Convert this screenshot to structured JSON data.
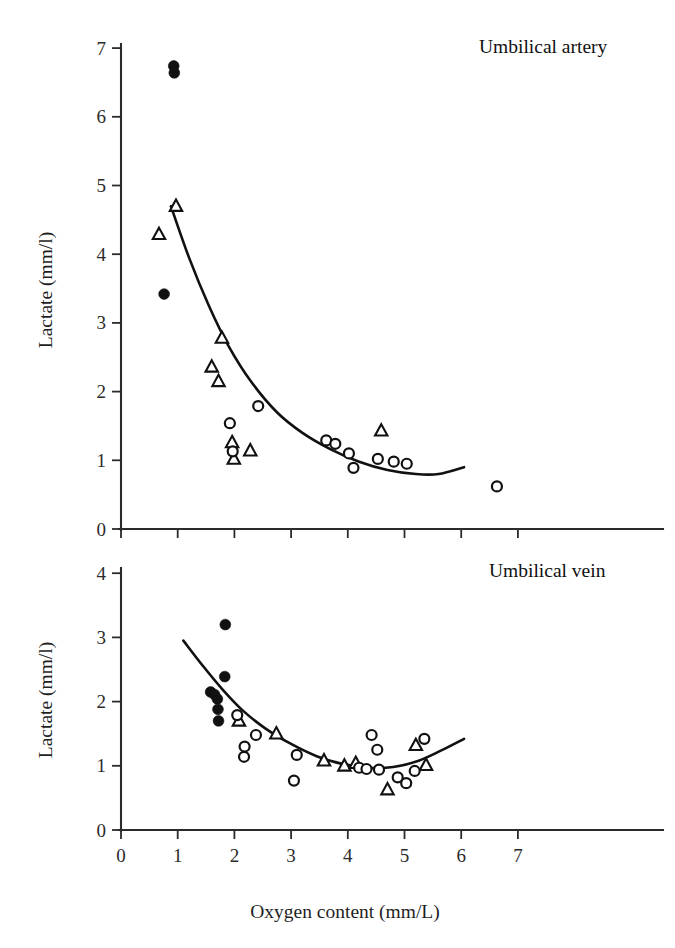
{
  "figure": {
    "axis_label_x": "Oxygen content (mm/L)",
    "axis_label_y": "Lactate (mm/l)",
    "panels": [
      {
        "id": "umbilical-artery",
        "title": "Umbilical artery"
      },
      {
        "id": "umbilical-vein",
        "title": "Umbilical vein"
      }
    ],
    "x_tick_labels": [
      "0",
      "1",
      "2",
      "3",
      "4",
      "5",
      "6",
      "7"
    ],
    "y_tick_labels_top": [
      "0",
      "1",
      "2",
      "3",
      "4",
      "5",
      "6",
      "7"
    ],
    "y_tick_labels_bottom": [
      "0",
      "1",
      "2",
      "3",
      "4"
    ],
    "colors": {
      "ink": "#111111",
      "axis": "#2b2b2b",
      "background": "#ffffff",
      "marker_fill_open": "#ffffff"
    }
  },
  "chart_data": [
    {
      "type": "scatter",
      "id": "umbilical-artery",
      "title": "Umbilical artery",
      "xlabel": "Oxygen content (mm/L)",
      "ylabel": "Lactate (mm/l)",
      "xlim": [
        0,
        7.8
      ],
      "ylim": [
        0,
        7
      ],
      "xticks": [
        0,
        1,
        2,
        3,
        4,
        5,
        6,
        7
      ],
      "yticks": [
        0,
        1,
        2,
        3,
        4,
        5,
        6,
        7
      ],
      "grid": false,
      "legend": null,
      "series": [
        {
          "name": "filled-circle",
          "marker": "filled-circle",
          "points": [
            [
              0.93,
              6.74
            ],
            [
              0.94,
              6.64
            ],
            [
              0.76,
              3.42
            ]
          ]
        },
        {
          "name": "open-triangle",
          "marker": "open-triangle",
          "points": [
            [
              0.97,
              4.7
            ],
            [
              0.67,
              4.29
            ],
            [
              1.78,
              2.78
            ],
            [
              1.6,
              2.36
            ],
            [
              1.72,
              2.15
            ],
            [
              1.96,
              1.26
            ],
            [
              1.99,
              1.02
            ],
            [
              2.28,
              1.14
            ],
            [
              4.59,
              1.43
            ]
          ]
        },
        {
          "name": "open-circle",
          "marker": "open-circle",
          "points": [
            [
              1.92,
              1.54
            ],
            [
              1.97,
              1.13
            ],
            [
              2.42,
              1.79
            ],
            [
              3.62,
              1.29
            ],
            [
              3.78,
              1.24
            ],
            [
              4.02,
              1.1
            ],
            [
              4.1,
              0.89
            ],
            [
              4.53,
              1.02
            ],
            [
              4.81,
              0.98
            ],
            [
              5.04,
              0.95
            ],
            [
              6.63,
              0.62
            ]
          ]
        }
      ],
      "fit_curve": {
        "name": "fitted-curve",
        "points": [
          [
            0.88,
            4.7
          ],
          [
            1.2,
            3.95
          ],
          [
            1.55,
            3.25
          ],
          [
            1.9,
            2.66
          ],
          [
            2.3,
            2.14
          ],
          [
            2.75,
            1.7
          ],
          [
            3.2,
            1.4
          ],
          [
            3.7,
            1.16
          ],
          [
            4.2,
            0.98
          ],
          [
            4.7,
            0.86
          ],
          [
            5.2,
            0.8
          ],
          [
            5.6,
            0.8
          ],
          [
            6.05,
            0.9
          ]
        ]
      }
    },
    {
      "type": "scatter",
      "id": "umbilical-vein",
      "title": "Umbilical vein",
      "xlabel": "Oxygen content (mm/L)",
      "ylabel": "Lactate (mm/l)",
      "xlim": [
        0,
        7.8
      ],
      "ylim": [
        0,
        4
      ],
      "xticks": [
        0,
        1,
        2,
        3,
        4,
        5,
        6,
        7
      ],
      "yticks": [
        0,
        1,
        2,
        3,
        4
      ],
      "grid": false,
      "legend": null,
      "series": [
        {
          "name": "filled-circle",
          "marker": "filled-circle",
          "points": [
            [
              1.84,
              3.2
            ],
            [
              1.83,
              2.39
            ],
            [
              1.58,
              2.15
            ],
            [
              1.65,
              2.11
            ],
            [
              1.7,
              2.04
            ],
            [
              1.71,
              1.88
            ],
            [
              1.72,
              1.7
            ]
          ]
        },
        {
          "name": "open-triangle",
          "marker": "open-triangle",
          "points": [
            [
              2.08,
              1.7
            ],
            [
              2.74,
              1.5
            ],
            [
              3.58,
              1.08
            ],
            [
              3.94,
              1.0
            ],
            [
              4.14,
              1.04
            ],
            [
              4.7,
              0.63
            ],
            [
              5.2,
              1.32
            ],
            [
              5.38,
              1.01
            ]
          ]
        },
        {
          "name": "open-circle",
          "marker": "open-circle",
          "points": [
            [
              2.05,
              1.79
            ],
            [
              2.18,
              1.3
            ],
            [
              2.17,
              1.14
            ],
            [
              2.38,
              1.48
            ],
            [
              3.05,
              0.77
            ],
            [
              3.1,
              1.17
            ],
            [
              4.2,
              0.97
            ],
            [
              4.33,
              0.95
            ],
            [
              4.42,
              1.48
            ],
            [
              4.52,
              1.25
            ],
            [
              4.55,
              0.94
            ],
            [
              4.88,
              0.82
            ],
            [
              5.03,
              0.73
            ],
            [
              5.18,
              0.92
            ],
            [
              5.35,
              1.42
            ]
          ]
        }
      ],
      "fit_curve": {
        "name": "fitted-curve",
        "points": [
          [
            1.1,
            2.95
          ],
          [
            1.45,
            2.55
          ],
          [
            1.8,
            2.18
          ],
          [
            2.15,
            1.86
          ],
          [
            2.55,
            1.58
          ],
          [
            3.0,
            1.34
          ],
          [
            3.45,
            1.15
          ],
          [
            3.9,
            1.03
          ],
          [
            4.35,
            0.97
          ],
          [
            4.8,
            0.98
          ],
          [
            5.25,
            1.08
          ],
          [
            5.65,
            1.24
          ],
          [
            6.05,
            1.42
          ]
        ]
      }
    }
  ]
}
